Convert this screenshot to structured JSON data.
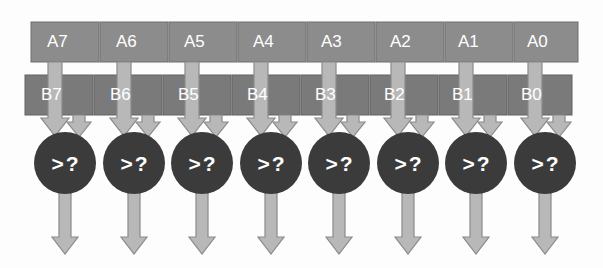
{
  "diagram": {
    "background_color": "#fdfdfd",
    "operand_a": {
      "name": "A",
      "bar_color": "#8c8c8c",
      "bar_border_color": "#6f6f6f",
      "label_color": "#ffffff",
      "cells": [
        {
          "label": "A7"
        },
        {
          "label": "A6"
        },
        {
          "label": "A5"
        },
        {
          "label": "A4"
        },
        {
          "label": "A3"
        },
        {
          "label": "A2"
        },
        {
          "label": "A1"
        },
        {
          "label": "A0"
        }
      ]
    },
    "operand_b": {
      "name": "B",
      "bar_color": "#7a7a7a",
      "bar_border_color": "#636363",
      "label_color": "#ffffff",
      "cells": [
        {
          "label": "B7"
        },
        {
          "label": "B6"
        },
        {
          "label": "B5"
        },
        {
          "label": "B4"
        },
        {
          "label": "B3"
        },
        {
          "label": "B2"
        },
        {
          "label": "B1"
        },
        {
          "label": "B0"
        }
      ]
    },
    "comparators": {
      "shape": "circle",
      "fill_color": "#3b3b3b",
      "label_color": "#ffffff",
      "nodes": [
        {
          "label": ">?"
        },
        {
          "label": ">?"
        },
        {
          "label": ">?"
        },
        {
          "label": ">?"
        },
        {
          "label": ">?"
        },
        {
          "label": ">?"
        },
        {
          "label": ">?"
        },
        {
          "label": ">?"
        }
      ]
    },
    "arrows": {
      "fill_color": "#b8b8b8",
      "stroke_color": "#8a8a8a",
      "input_a_name": "a-input-arrow",
      "input_b_name": "b-input-arrow",
      "output_name": "comparator-output-arrow",
      "count": 8
    }
  }
}
